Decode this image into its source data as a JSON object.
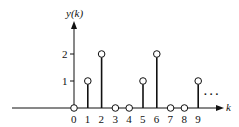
{
  "chart_data": {
    "type": "stem",
    "title": "",
    "ylabel": "y(k)",
    "xlabel": "k",
    "x": [
      0,
      1,
      2,
      3,
      4,
      5,
      6,
      7,
      8,
      9
    ],
    "values": [
      0,
      1,
      2,
      0,
      0,
      1,
      2,
      0,
      0,
      1
    ],
    "x_tick_labels": [
      "0",
      "1",
      "2",
      "3",
      "4",
      "5",
      "6",
      "7",
      "8",
      "9"
    ],
    "y_tick_labels": [
      "1",
      "2"
    ],
    "y_ticks": [
      1,
      2
    ],
    "continuation": "...",
    "grid": false,
    "marker": "open-circle"
  },
  "colors": {
    "line": "#111111",
    "background": "#ffffff"
  }
}
